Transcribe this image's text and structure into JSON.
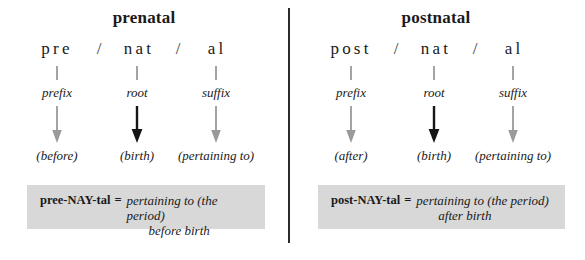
{
  "panels": [
    {
      "title": "prenatal",
      "columns": [
        {
          "morpheme": "pre",
          "part": "prefix",
          "gloss": "(before)",
          "arrow_color": "#9a9a9a"
        },
        {
          "morpheme": "nat",
          "part": "root",
          "gloss": "(birth)",
          "arrow_color": "#161616"
        },
        {
          "morpheme": "al",
          "part": "suffix",
          "gloss": "(pertaining to)",
          "arrow_color": "#9a9a9a"
        }
      ],
      "separators": [
        "/",
        "/"
      ],
      "definition": {
        "pronunciation": "pree-NAY-tal",
        "equals": "=",
        "line1": "pertaining to (the period)",
        "line2": "before birth"
      }
    },
    {
      "title": "postnatal",
      "columns": [
        {
          "morpheme": "post",
          "part": "prefix",
          "gloss": "(after)",
          "arrow_color": "#9a9a9a"
        },
        {
          "morpheme": "nat",
          "part": "root",
          "gloss": "(birth)",
          "arrow_color": "#161616"
        },
        {
          "morpheme": "al",
          "part": "suffix",
          "gloss": "(pertaining to)",
          "arrow_color": "#9a9a9a"
        }
      ],
      "separators": [
        "/",
        "/"
      ],
      "definition": {
        "pronunciation": "post-NAY-tal",
        "equals": "=",
        "line1": "pertaining to (the period)",
        "line2": "after birth"
      }
    }
  ],
  "colors": {
    "box_background": "#d8d8d8",
    "divider": "#2b2b2b",
    "text": "#1a1a1a",
    "arrow_gray": "#9a9a9a",
    "arrow_black": "#161616"
  }
}
